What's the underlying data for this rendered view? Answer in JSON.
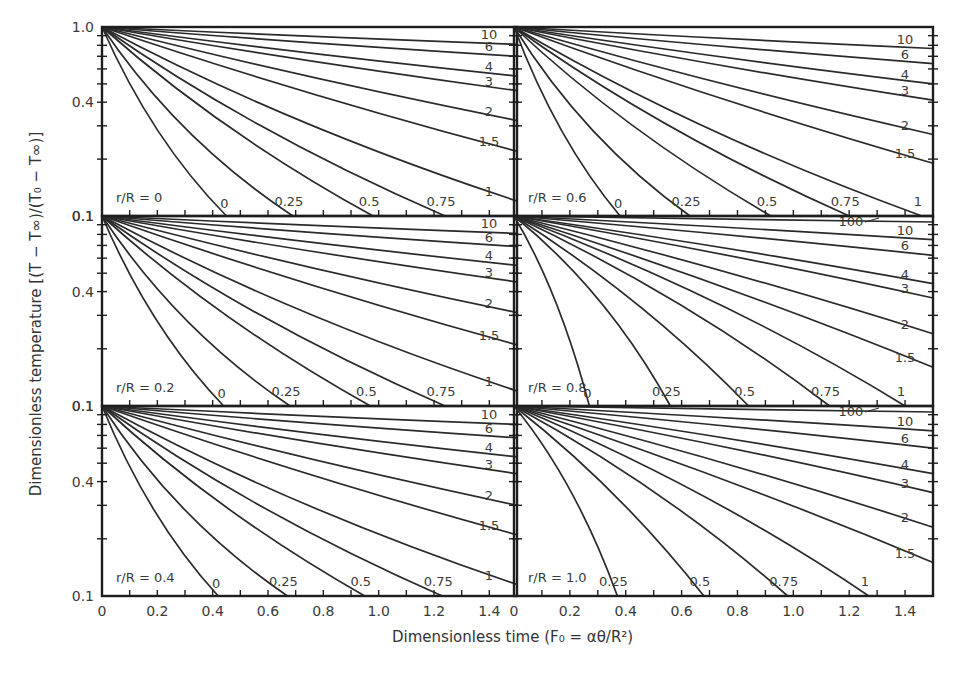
{
  "chart_data": {
    "type": "line",
    "title": "",
    "xlabel": "Dimensionless time (F₀ = αθ/R²)",
    "ylabel": "Dimensionless temperature [(T − T∞)/(T₀ − T∞)]",
    "yscale": "log",
    "ylim": [
      0.1,
      1.0
    ],
    "xlim": [
      0,
      1.5
    ],
    "x_ticks": [
      "0",
      "0.2",
      "0.4",
      "0.6",
      "0.8",
      "1.0",
      "1.2",
      "1.4"
    ],
    "y_ticks": [
      "1.0",
      "0.4",
      "0.1"
    ],
    "grid": false,
    "legend": "inline curve labels (Biot number)",
    "layout": "3 rows x 2 columns of panels",
    "panels": [
      {
        "label": "r/R = 0",
        "series": [
          {
            "name": "0",
            "end": [
              0.45,
              0.1
            ]
          },
          {
            "name": "0.25",
            "end": [
              0.69,
              0.1
            ]
          },
          {
            "name": "0.5",
            "end": [
              0.98,
              0.1
            ]
          },
          {
            "name": "0.75",
            "end": [
              1.24,
              0.1
            ]
          },
          {
            "name": "1",
            "end": [
              1.5,
              0.12
            ]
          },
          {
            "name": "1.5",
            "end": [
              1.5,
              0.22
            ]
          },
          {
            "name": "2",
            "end": [
              1.5,
              0.32
            ]
          },
          {
            "name": "3",
            "end": [
              1.5,
              0.46
            ]
          },
          {
            "name": "4",
            "end": [
              1.5,
              0.55
            ]
          },
          {
            "name": "6",
            "end": [
              1.5,
              0.7
            ]
          },
          {
            "name": "10",
            "end": [
              1.5,
              0.81
            ]
          }
        ]
      },
      {
        "label": "r/R = 0.6",
        "series": [
          {
            "name": "0",
            "end": [
              0.38,
              0.1
            ]
          },
          {
            "name": "0.25",
            "end": [
              0.63,
              0.1
            ]
          },
          {
            "name": "0.5",
            "end": [
              0.92,
              0.1
            ]
          },
          {
            "name": "0.75",
            "end": [
              1.2,
              0.1
            ]
          },
          {
            "name": "1",
            "end": [
              1.46,
              0.1
            ]
          },
          {
            "name": "1.5",
            "end": [
              1.5,
              0.19
            ]
          },
          {
            "name": "2",
            "end": [
              1.5,
              0.27
            ]
          },
          {
            "name": "3",
            "end": [
              1.5,
              0.41
            ]
          },
          {
            "name": "4",
            "end": [
              1.5,
              0.5
            ]
          },
          {
            "name": "6",
            "end": [
              1.5,
              0.64
            ]
          },
          {
            "name": "10",
            "end": [
              1.5,
              0.77
            ]
          }
        ]
      },
      {
        "label": "r/R = 0.2",
        "series": [
          {
            "name": "0",
            "end": [
              0.44,
              0.1
            ]
          },
          {
            "name": "0.25",
            "end": [
              0.68,
              0.1
            ]
          },
          {
            "name": "0.5",
            "end": [
              0.97,
              0.1
            ]
          },
          {
            "name": "0.75",
            "end": [
              1.24,
              0.1
            ]
          },
          {
            "name": "1",
            "end": [
              1.5,
              0.12
            ]
          },
          {
            "name": "1.5",
            "end": [
              1.5,
              0.21
            ]
          },
          {
            "name": "2",
            "end": [
              1.5,
              0.31
            ]
          },
          {
            "name": "3",
            "end": [
              1.5,
              0.45
            ]
          },
          {
            "name": "4",
            "end": [
              1.5,
              0.55
            ]
          },
          {
            "name": "6",
            "end": [
              1.5,
              0.69
            ]
          },
          {
            "name": "10",
            "end": [
              1.5,
              0.81
            ]
          }
        ]
      },
      {
        "label": "r/R = 0.8",
        "series": [
          {
            "name": "0",
            "end": [
              0.27,
              0.1
            ]
          },
          {
            "name": "0.25",
            "end": [
              0.56,
              0.1
            ]
          },
          {
            "name": "0.5",
            "end": [
              0.84,
              0.1
            ]
          },
          {
            "name": "0.75",
            "end": [
              1.13,
              0.1
            ]
          },
          {
            "name": "1",
            "end": [
              1.4,
              0.1
            ]
          },
          {
            "name": "1.5",
            "end": [
              1.5,
              0.16
            ]
          },
          {
            "name": "2",
            "end": [
              1.5,
              0.24
            ]
          },
          {
            "name": "3",
            "end": [
              1.5,
              0.37
            ]
          },
          {
            "name": "4",
            "end": [
              1.5,
              0.44
            ]
          },
          {
            "name": "6",
            "end": [
              1.5,
              0.62
            ]
          },
          {
            "name": "10",
            "end": [
              1.5,
              0.75
            ]
          },
          {
            "name": "100",
            "end": [
              1.5,
              0.93
            ]
          }
        ]
      },
      {
        "label": "r/R = 0.4",
        "series": [
          {
            "name": "0",
            "end": [
              0.42,
              0.1
            ]
          },
          {
            "name": "0.25",
            "end": [
              0.67,
              0.1
            ]
          },
          {
            "name": "0.5",
            "end": [
              0.95,
              0.1
            ]
          },
          {
            "name": "0.75",
            "end": [
              1.23,
              0.1
            ]
          },
          {
            "name": "1",
            "end": [
              1.5,
              0.115
            ]
          },
          {
            "name": "1.5",
            "end": [
              1.5,
              0.21
            ]
          },
          {
            "name": "2",
            "end": [
              1.5,
              0.3
            ]
          },
          {
            "name": "3",
            "end": [
              1.5,
              0.44
            ]
          },
          {
            "name": "4",
            "end": [
              1.5,
              0.54
            ]
          },
          {
            "name": "6",
            "end": [
              1.5,
              0.68
            ]
          },
          {
            "name": "10",
            "end": [
              1.5,
              0.8
            ]
          }
        ]
      },
      {
        "label": "r/R = 1.0",
        "series": [
          {
            "name": "0.25",
            "end": [
              0.37,
              0.1
            ]
          },
          {
            "name": "0.5",
            "end": [
              0.68,
              0.1
            ]
          },
          {
            "name": "0.75",
            "end": [
              0.98,
              0.1
            ]
          },
          {
            "name": "1",
            "end": [
              1.27,
              0.1
            ]
          },
          {
            "name": "1.5",
            "end": [
              1.5,
              0.15
            ]
          },
          {
            "name": "2",
            "end": [
              1.5,
              0.23
            ]
          },
          {
            "name": "3",
            "end": [
              1.5,
              0.35
            ]
          },
          {
            "name": "4",
            "end": [
              1.5,
              0.44
            ]
          },
          {
            "name": "6",
            "end": [
              1.5,
              0.6
            ]
          },
          {
            "name": "10",
            "end": [
              1.5,
              0.74
            ]
          },
          {
            "name": "100",
            "end": [
              1.5,
              0.93
            ]
          }
        ]
      }
    ]
  },
  "labels": {
    "x_axis_title": "Dimensionless time (F₀ = αθ/R²)",
    "y_axis_title": "Dimensionless temperature [(T − T∞)/(T₀ − T∞)]"
  },
  "style": {
    "line_color": "#2a2a2a",
    "frame_color": "#1e1e1e",
    "text_color": "#3a3a3a",
    "background": "#ffffff"
  }
}
